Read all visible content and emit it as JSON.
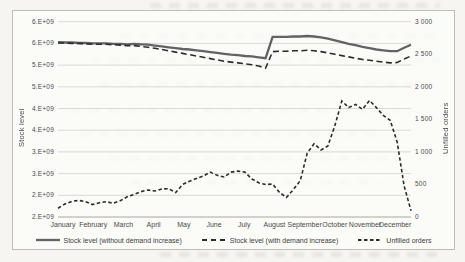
{
  "chart_data": {
    "type": "line",
    "title": "",
    "x_axis": {
      "categories": [
        "January",
        "February",
        "March",
        "April",
        "May",
        "June",
        "July",
        "August",
        "September",
        "October",
        "November",
        "December"
      ],
      "points": 52
    },
    "y_left": {
      "label": "Stock level",
      "tick_labels_top_to_bottom": [
        "6.E+09",
        "6.E+09",
        "5.E+09",
        "5.E+09",
        "4.E+09",
        "4.E+09",
        "3.E+09",
        "3.E+09",
        "2.E+09",
        "2.E+09"
      ],
      "range": [
        2000000000,
        6500000000
      ],
      "grid": true
    },
    "y_right": {
      "label": "Unfilled orders",
      "tick_labels_top_to_bottom": [
        "3 000",
        "2 500",
        "2 000",
        "1 500",
        "1 000",
        "500",
        "0"
      ],
      "range": [
        0,
        3000
      ]
    },
    "legend_position": "bottom",
    "series": [
      {
        "name": "Stock level (without demand increase)",
        "axis": "left",
        "style": "solid",
        "color": "#636363",
        "unit": "1e9",
        "values": [
          6.03,
          6.02,
          6.02,
          6.01,
          6.01,
          6.0,
          6.0,
          6.0,
          5.99,
          5.99,
          5.98,
          5.99,
          5.98,
          5.97,
          5.95,
          5.93,
          5.91,
          5.89,
          5.87,
          5.86,
          5.84,
          5.82,
          5.8,
          5.78,
          5.76,
          5.74,
          5.73,
          5.71,
          5.7,
          5.68,
          5.66,
          6.15,
          6.15,
          6.15,
          6.16,
          6.16,
          6.17,
          6.16,
          6.14,
          6.11,
          6.07,
          6.03,
          5.99,
          5.96,
          5.92,
          5.89,
          5.86,
          5.84,
          5.82,
          5.82,
          5.9,
          5.97
        ]
      },
      {
        "name": "Stock level (with demand increase)",
        "axis": "left",
        "style": "dashed",
        "color": "#2b2b2b",
        "unit": "1e9",
        "values": [
          6.01,
          6.01,
          6.0,
          6.0,
          5.99,
          5.98,
          5.98,
          5.98,
          5.97,
          5.96,
          5.95,
          5.95,
          5.93,
          5.91,
          5.89,
          5.86,
          5.83,
          5.8,
          5.77,
          5.74,
          5.71,
          5.68,
          5.65,
          5.62,
          5.59,
          5.57,
          5.55,
          5.53,
          5.51,
          5.48,
          5.43,
          5.81,
          5.82,
          5.82,
          5.83,
          5.83,
          5.84,
          5.83,
          5.81,
          5.78,
          5.75,
          5.72,
          5.69,
          5.66,
          5.63,
          5.61,
          5.59,
          5.57,
          5.55,
          5.56,
          5.64,
          5.71
        ]
      },
      {
        "name": "Unfilled orders",
        "axis": "right",
        "style": "short-dashed",
        "color": "#2b2b2b",
        "unit": "orders",
        "values": [
          135,
          200,
          240,
          255,
          235,
          190,
          220,
          235,
          210,
          250,
          310,
          345,
          390,
          415,
          400,
          430,
          435,
          375,
          500,
          550,
          590,
          630,
          690,
          640,
          615,
          690,
          705,
          690,
          585,
          525,
          500,
          505,
          380,
          300,
          420,
          560,
          980,
          1125,
          1030,
          1090,
          1405,
          1780,
          1680,
          1730,
          1655,
          1790,
          1680,
          1560,
          1485,
          1150,
          480,
          95
        ]
      }
    ],
    "colors": {
      "grid": "#d2d0cb",
      "axis": "#a8a6a1",
      "text": "#4a4a4a"
    }
  }
}
